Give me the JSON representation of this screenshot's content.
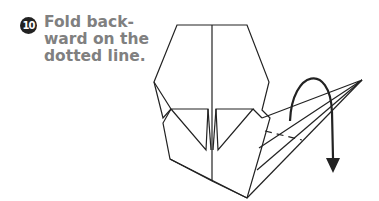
{
  "step": {
    "number": "10",
    "instruction": "Fold back-\nward on the\ndotted line."
  },
  "diagram": {
    "line_color": "#222222",
    "text_color": "#808080"
  }
}
